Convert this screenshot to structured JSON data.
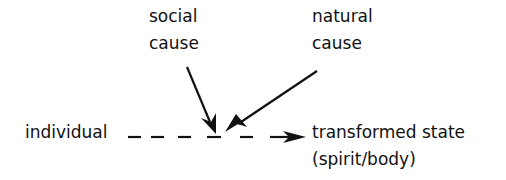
{
  "diagram": {
    "nodes": {
      "social_cause": {
        "line1": "social",
        "line2": "cause"
      },
      "natural_cause": {
        "line1": "natural",
        "line2": "cause"
      },
      "individual": {
        "label": "individual"
      },
      "transformed_state": {
        "line1": "transformed state",
        "line2": "(spirit/body)"
      }
    },
    "edges": [
      {
        "from": "social cause",
        "to": "junction",
        "style": "solid-arrow"
      },
      {
        "from": "natural cause",
        "to": "junction",
        "style": "solid-arrow"
      },
      {
        "from": "individual",
        "to": "transformed state",
        "style": "dashed-arrow"
      }
    ],
    "colors": {
      "ink": "#111111",
      "background": "#ffffff"
    }
  }
}
